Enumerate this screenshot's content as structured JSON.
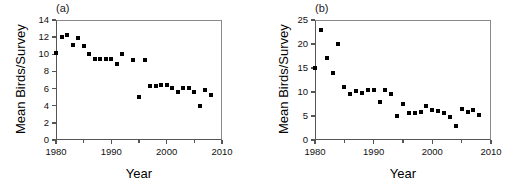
{
  "figure": {
    "width": 530,
    "height": 186,
    "background": "#ffffff",
    "marker_color": "#000000",
    "axis_color": "#555555"
  },
  "chart_data": [
    {
      "type": "scatter",
      "panel_label": "(a)",
      "title": "",
      "xlabel": "Year",
      "ylabel": "Mean Birds/Survey",
      "xlim": [
        1980,
        2010
      ],
      "ylim": [
        0,
        14
      ],
      "xticks": [
        1980,
        1990,
        2000,
        2010
      ],
      "xtick_labels": [
        "1980",
        "1990",
        "2000",
        "2010"
      ],
      "xminor_ticks": [
        1985,
        1995,
        2005
      ],
      "yticks": [
        0,
        2,
        4,
        6,
        8,
        10,
        12,
        14
      ],
      "ytick_labels": [
        "0",
        "2",
        "4",
        "6",
        "8",
        "10",
        "12",
        "14"
      ],
      "grid": false,
      "legend": false,
      "x": [
        1980,
        1981,
        1982,
        1983,
        1984,
        1985,
        1986,
        1987,
        1988,
        1989,
        1990,
        1991,
        1992,
        1994,
        1995,
        1996,
        1997,
        1998,
        1999,
        2000,
        2001,
        2002,
        2003,
        2004,
        2005,
        2006,
        2007,
        2008
      ],
      "y": [
        10.2,
        12.0,
        12.2,
        11.1,
        11.9,
        11.0,
        10.0,
        9.4,
        9.4,
        9.4,
        9.4,
        8.9,
        10.0,
        9.3,
        5.0,
        9.3,
        6.3,
        6.3,
        6.4,
        6.4,
        6.1,
        5.6,
        6.1,
        6.1,
        5.6,
        4.0,
        5.8,
        5.2
      ]
    },
    {
      "type": "scatter",
      "panel_label": "(b)",
      "title": "",
      "xlabel": "Year",
      "ylabel": "Mean Birds/Survey",
      "xlim": [
        1980,
        2010
      ],
      "ylim": [
        0,
        25
      ],
      "xticks": [
        1980,
        1990,
        2000,
        2010
      ],
      "xtick_labels": [
        "1980",
        "1990",
        "2000",
        "2010"
      ],
      "xminor_ticks": [
        1985,
        1995,
        2005
      ],
      "yticks": [
        0,
        5,
        10,
        15,
        20,
        25
      ],
      "ytick_labels": [
        "0",
        "5",
        "10",
        "15",
        "20",
        "25"
      ],
      "grid": false,
      "legend": false,
      "x": [
        1980,
        1981,
        1982,
        1983,
        1984,
        1985,
        1986,
        1987,
        1988,
        1989,
        1990,
        1991,
        1992,
        1993,
        1994,
        1995,
        1996,
        1997,
        1998,
        1999,
        2000,
        2001,
        2002,
        2003,
        2004,
        2005,
        2006,
        2007,
        2008
      ],
      "y": [
        15.0,
        23.0,
        17.0,
        14.0,
        20.0,
        11.0,
        9.5,
        10.3,
        9.7,
        10.5,
        10.4,
        8.0,
        10.4,
        9.5,
        5.0,
        7.4,
        5.6,
        5.7,
        5.9,
        7.0,
        6.3,
        6.0,
        5.6,
        4.8,
        3.0,
        6.4,
        5.8,
        6.3,
        5.3
      ]
    }
  ]
}
